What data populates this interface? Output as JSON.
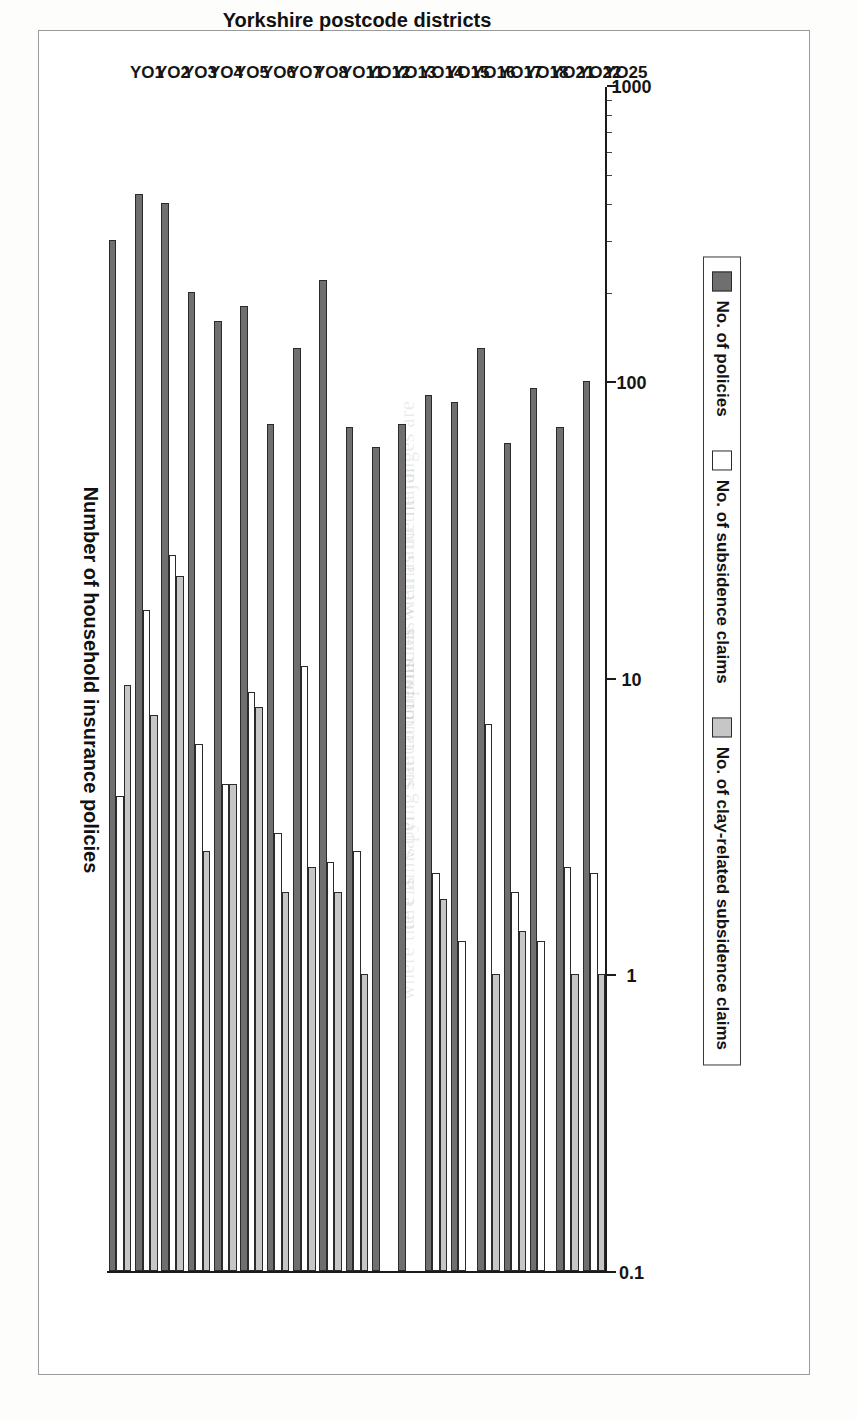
{
  "chart_data": {
    "type": "bar",
    "orientation": "horizontal",
    "title": "",
    "xlabel": "Yorkshire postcode districts",
    "ylabel": "Number of household insurance policies",
    "yscale": "log",
    "ylim": [
      0.1,
      1000
    ],
    "ytick_labels": [
      "1000",
      "100",
      "10",
      "1",
      "0.1"
    ],
    "ytick_values": [
      1000,
      100,
      10,
      1,
      0.1
    ],
    "grid": false,
    "legend_position": "bottom-right",
    "categories": [
      "YO1",
      "YO2",
      "YO3",
      "YO4",
      "YO5",
      "YO6",
      "YO7",
      "YO8",
      "YO11",
      "YO12",
      "YO13",
      "YO14",
      "YO15",
      "YO16",
      "YO17",
      "YO18",
      "YO21",
      "YO22",
      "YO25"
    ],
    "series": [
      {
        "name": "No. of policies",
        "color": "#6f6f6f",
        "values": [
          300,
          430,
          400,
          200,
          160,
          180,
          72,
          130,
          220,
          70,
          60,
          72,
          90,
          85,
          130,
          62,
          95,
          70,
          100
        ]
      },
      {
        "name": "No. of subsidence claims",
        "color": "#ffffff",
        "values": [
          4,
          17,
          26,
          6,
          4.4,
          9,
          3,
          11,
          2.4,
          2.6,
          null,
          null,
          2.2,
          1.3,
          7,
          1.9,
          1.3,
          2.3,
          2.2
        ]
      },
      {
        "name": "No. of clay-related subsidence claims",
        "color": "#c6c6c6",
        "values": [
          9.5,
          7.5,
          22,
          2.6,
          4.4,
          8,
          1.9,
          2.3,
          1.9,
          1.0,
          null,
          null,
          1.8,
          null,
          1.0,
          1.4,
          null,
          1.0,
          1.0
        ]
      }
    ]
  },
  "legend": {
    "items": [
      {
        "label": "No. of policies",
        "swatch": "s0"
      },
      {
        "label": "No. of subsidence claims",
        "swatch": "s1"
      },
      {
        "label": "No. of clay-related subsidence claims",
        "swatch": "s2"
      }
    ]
  },
  "ghost_text": [
    "and the ranges are",
    "as well as the major",
    "of policies within",
    "standard deviation",
    "varying site conditions",
    "ce claims per",
    "where there is"
  ]
}
